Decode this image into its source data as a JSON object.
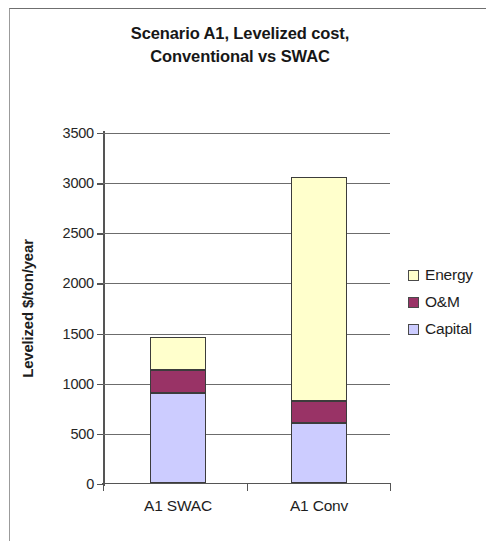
{
  "chart_data": {
    "type": "bar",
    "subtype": "stacked-column",
    "title": "Scenario A1, Levelized cost, Conventional vs SWAC",
    "title_lines": [
      "Scenario A1, Levelized cost,",
      "Conventional vs SWAC"
    ],
    "categories": [
      "A1 SWAC",
      "A1 Conv"
    ],
    "series": [
      {
        "name": "Capital",
        "values": [
          900,
          600
        ],
        "color": "#ccccff"
      },
      {
        "name": "O&M",
        "values": [
          225,
          220
        ],
        "color": "#993366"
      },
      {
        "name": "Energy",
        "values": [
          335,
          2230
        ],
        "color": "#ffffcc"
      }
    ],
    "totals": [
      1460,
      3050
    ],
    "xlabel": "",
    "ylabel": "Levelized $/ton/year",
    "ylim": [
      0,
      3500
    ],
    "ytick_step": 500,
    "ytick_labels": [
      "3500",
      "3000",
      "2500",
      "2000",
      "1500",
      "1000",
      "500",
      "0"
    ],
    "ytick_values": [
      3500,
      3000,
      2500,
      2000,
      1500,
      1000,
      500,
      0
    ],
    "grid": true,
    "grid_axis": "y",
    "legend_position": "right",
    "legend_entries": [
      "Energy",
      "O&M",
      "Capital"
    ],
    "plot_background": "#ffffff"
  },
  "legend": {
    "items": [
      {
        "label": "Energy",
        "color": "#ffffcc"
      },
      {
        "label": "O&M",
        "color": "#993366"
      },
      {
        "label": "Capital",
        "color": "#ccccff"
      }
    ]
  },
  "axis": {
    "y_title": "Levelized $/ton/year"
  }
}
